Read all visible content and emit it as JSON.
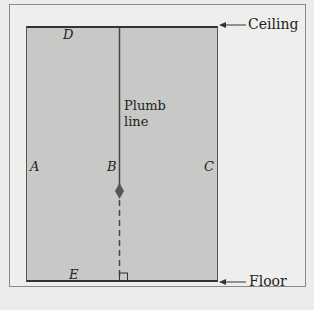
{
  "diagram": {
    "labels": {
      "ceiling": "Ceiling",
      "floor": "Floor",
      "plumb_line_1": "Plumb",
      "plumb_line_2": "line",
      "A": "A",
      "B": "B",
      "C": "C",
      "D": "D",
      "E": "E"
    },
    "colors": {
      "wall_fill": "#c8c8c6",
      "background": "#eeeeec",
      "line": "#333333",
      "bob": "#555555"
    }
  }
}
